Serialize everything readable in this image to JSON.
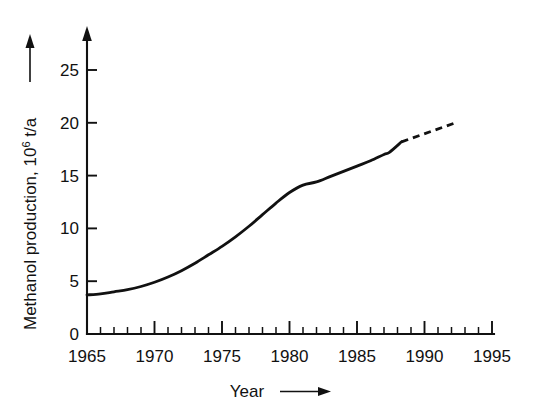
{
  "chart_data": {
    "type": "line",
    "title": "",
    "xlabel": "Year",
    "ylabel": "Methanol production, 10^6 t/a",
    "ylabel_base": "Methanol  production,  10",
    "ylabel_sup": "6",
    "ylabel_unit": " t/a",
    "xlabel_text": "Year",
    "xlim": [
      1965,
      1995
    ],
    "ylim": [
      0,
      27.5
    ],
    "x_major_ticks": [
      1965,
      1970,
      1975,
      1980,
      1985,
      1990,
      1995
    ],
    "x_major_tick_labels": [
      "1965",
      "1970",
      "1975",
      "1980",
      "1985",
      "1990",
      "1995"
    ],
    "x_minor_tick_step": 1,
    "y_major_ticks": [
      0,
      5,
      10,
      15,
      20,
      25
    ],
    "y_major_tick_labels": [
      "0",
      "5",
      "10",
      "15",
      "20",
      "25"
    ],
    "grid": false,
    "legend": "none",
    "axis_arrows": {
      "x": "right",
      "y": "up"
    },
    "line_color": "#111111",
    "series": [
      {
        "name": "Methanol production (actual)",
        "style": "solid",
        "x": [
          1965,
          1966,
          1967,
          1968,
          1969,
          1970,
          1971,
          1972,
          1973,
          1974,
          1975,
          1976,
          1977,
          1978,
          1979,
          1980,
          1981,
          1982,
          1983,
          1984,
          1985,
          1986,
          1987,
          1987.4,
          1988.3
        ],
        "values": [
          3.7,
          3.8,
          4.0,
          4.2,
          4.5,
          4.9,
          5.4,
          6.0,
          6.7,
          7.5,
          8.3,
          9.2,
          10.2,
          11.3,
          12.4,
          13.4,
          14.1,
          14.4,
          14.9,
          15.4,
          15.9,
          16.4,
          17.0,
          17.2,
          18.2
        ]
      },
      {
        "name": "Methanol production (projected)",
        "style": "dashed",
        "x": [
          1988.3,
          1992.3
        ],
        "values": [
          18.2,
          20.0
        ]
      }
    ],
    "annotations": []
  },
  "axis_geometry": {
    "x_origin_px": 87,
    "y_origin_px": 334,
    "x_end_px": 492,
    "y_top_px": 36,
    "px_per_year": 13.5,
    "px_per_unit": 10.56
  },
  "colors": {
    "background": "#ffffff",
    "ink": "#111111"
  }
}
